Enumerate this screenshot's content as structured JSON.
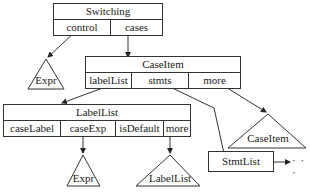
{
  "diagram": {
    "switching": {
      "title": "Switching",
      "fields": [
        "control",
        "cases"
      ]
    },
    "caseitem": {
      "title": "CaseItem",
      "fields": [
        "labelList",
        "stmts",
        "more"
      ]
    },
    "labellist": {
      "title": "LabelList",
      "fields": [
        "caseLabel",
        "caseExp",
        "isDefault",
        "more"
      ]
    },
    "stmtlist": {
      "title": "StmtList"
    },
    "triangles": {
      "expr_top": "Expr",
      "caseitem_sub": "CaseItem",
      "expr_bottom": "Expr",
      "labellist_sub": "LabelList"
    },
    "continuation": "· · ·"
  }
}
